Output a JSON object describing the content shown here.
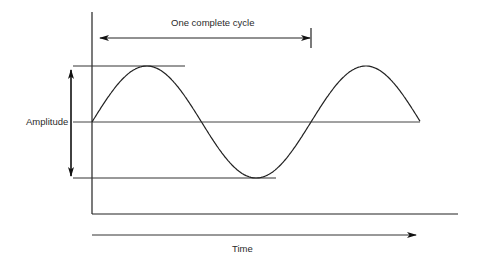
{
  "diagram": {
    "type": "sine-wave-annotation",
    "labels": {
      "cycle": "One complete cycle",
      "amplitude": "Amplitude",
      "time": "Time"
    },
    "colors": {
      "stroke": "#222222",
      "reference_line": "#444444",
      "background": "#ffffff"
    },
    "wave": {
      "function": "sine",
      "cycles_shown": 1.5,
      "start": "zero-crossing rising",
      "end": "zero-crossing after second peak"
    },
    "annotations": [
      {
        "name": "one-complete-cycle-arrow",
        "kind": "double-headed horizontal arrow with end tick"
      },
      {
        "name": "amplitude-arrow",
        "kind": "double-headed vertical arrow between peak and trough reference lines"
      },
      {
        "name": "time-arrow",
        "kind": "right-pointing arrow below x-axis"
      }
    ]
  }
}
